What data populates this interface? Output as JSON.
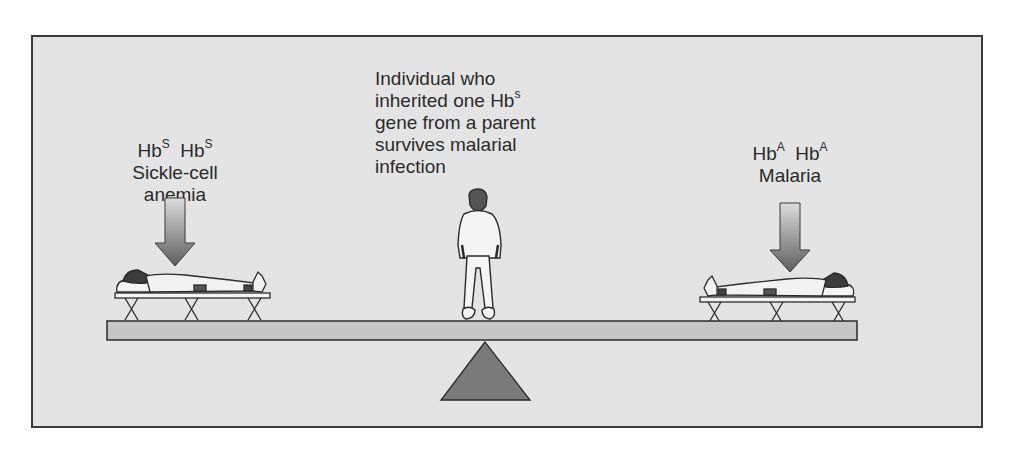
{
  "diagram": {
    "left": {
      "genotype": [
        "Hb",
        "S",
        "Hb",
        "S"
      ],
      "lines": [
        "Sickle-cell",
        "anemia"
      ]
    },
    "center": {
      "lines": [
        "Individual who",
        "inherited one Hb",
        "gene from a parent",
        "survives malarial",
        "infection"
      ],
      "superscript": "s"
    },
    "right": {
      "genotype": [
        "Hb",
        "A",
        "Hb",
        "A"
      ],
      "lines": [
        "Malaria"
      ]
    },
    "elements": {
      "left_figure": "patient-lying-on-cot",
      "center_figure": "person-standing",
      "right_figure": "patient-lying-on-cot",
      "fulcrum": "triangle",
      "beam": "seesaw-plank",
      "arrows": "down-arrow"
    },
    "colors": {
      "background": "#e4e4e4",
      "frame": "#3a3a3a",
      "beam": "#c6c6c6",
      "fulcrum": "#7a7a7a",
      "arrow_top": "#d8d8d8",
      "arrow_bottom": "#6a6a6a",
      "text": "#2b2b2b"
    }
  }
}
